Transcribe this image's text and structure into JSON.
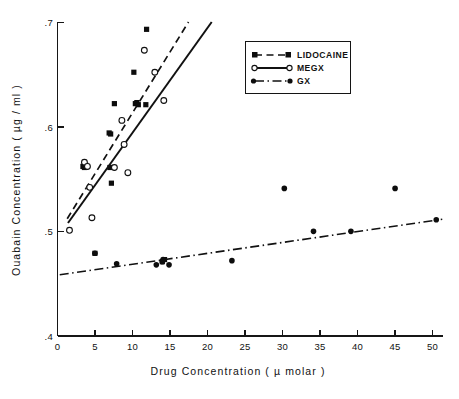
{
  "chart_data": {
    "type": "scatter",
    "title": "",
    "xlabel": "Drug Concentration ( µ molar )",
    "ylabel": "Ouabain Concentration ( µg / ml )",
    "xlim": [
      0,
      51.5
    ],
    "ylim": [
      0.4,
      0.7
    ],
    "xticks": [
      0,
      5,
      10,
      15,
      20,
      25,
      30,
      35,
      40,
      45,
      50
    ],
    "xticklabels": [
      "0",
      "5",
      "10",
      "15",
      "20",
      "25",
      "30",
      "35",
      "40",
      "45",
      "50"
    ],
    "yticks": [
      0.4,
      0.5,
      0.6,
      0.7
    ],
    "yticklabels": [
      ".4",
      ".5",
      ".6",
      ".7"
    ],
    "grid": false,
    "legend_position": "upper right",
    "series": [
      {
        "name": "LIDOCAINE",
        "marker": "filled-square",
        "line_style": "dashed",
        "points": [
          [
            3.4,
            0.562
          ],
          [
            3.6,
            0.561
          ],
          [
            3.8,
            0.563
          ],
          [
            5.0,
            0.479
          ],
          [
            6.9,
            0.594
          ],
          [
            7.1,
            0.593
          ],
          [
            7.0,
            0.561
          ],
          [
            7.2,
            0.546
          ],
          [
            7.6,
            0.622
          ],
          [
            10.4,
            0.622
          ],
          [
            10.6,
            0.623
          ],
          [
            10.8,
            0.621
          ],
          [
            10.2,
            0.652
          ],
          [
            11.9,
            0.693
          ],
          [
            11.8,
            0.621
          ],
          [
            14.0,
            0.471
          ],
          [
            14.3,
            0.473
          ]
        ],
        "fit_line": {
          "x": [
            1.3,
            17.5
          ],
          "y": [
            0.512,
            0.7
          ]
        }
      },
      {
        "name": "MEGX",
        "marker": "open-circle",
        "line_style": "solid",
        "points": [
          [
            1.6,
            0.501
          ],
          [
            3.6,
            0.566
          ],
          [
            4.0,
            0.562
          ],
          [
            4.3,
            0.542
          ],
          [
            4.6,
            0.513
          ],
          [
            7.6,
            0.561
          ],
          [
            8.6,
            0.606
          ],
          [
            8.9,
            0.583
          ],
          [
            9.4,
            0.556
          ],
          [
            11.6,
            0.673
          ],
          [
            13.0,
            0.652
          ],
          [
            14.2,
            0.625
          ]
        ],
        "fit_line": {
          "x": [
            1.4,
            20.6
          ],
          "y": [
            0.508,
            0.7
          ]
        }
      },
      {
        "name": "GX",
        "marker": "filled-circle",
        "line_style": "dash-dot",
        "points": [
          [
            5.0,
            0.479
          ],
          [
            7.9,
            0.469
          ],
          [
            13.2,
            0.468
          ],
          [
            14.0,
            0.471
          ],
          [
            14.1,
            0.473
          ],
          [
            14.9,
            0.468
          ],
          [
            23.3,
            0.472
          ],
          [
            30.3,
            0.541
          ],
          [
            34.2,
            0.5
          ],
          [
            39.2,
            0.5
          ],
          [
            45.1,
            0.541
          ],
          [
            50.6,
            0.511
          ]
        ],
        "fit_line": {
          "x": [
            0.3,
            51.4
          ],
          "y": [
            0.4585,
            0.5115
          ]
        }
      }
    ]
  },
  "legend": {
    "entries": [
      {
        "label": "LIDOCAINE",
        "marker": "filled-square",
        "line_style": "dashed"
      },
      {
        "label": "MEGX",
        "marker": "open-circle",
        "line_style": "solid"
      },
      {
        "label": "GX",
        "marker": "filled-circle",
        "line_style": "dash-dot"
      }
    ]
  },
  "colors": {
    "ink": "#111111",
    "background": "#ffffff"
  }
}
